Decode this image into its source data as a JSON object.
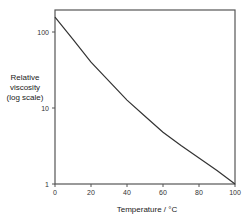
{
  "chart_data": {
    "type": "line",
    "title": "",
    "xlabel": "Temperature / °C",
    "ylabel": "Relative viscosity (log scale)",
    "ylabel_lines": [
      "Relative",
      "viscosity",
      "(log scale)"
    ],
    "yscale": "log",
    "xlim": [
      0,
      100
    ],
    "ylim": [
      1,
      195
    ],
    "x_ticks": [
      "0",
      "20",
      "40",
      "60",
      "80",
      "100"
    ],
    "y_ticks": [
      "1",
      "10",
      "100"
    ],
    "grid": false,
    "legend": null,
    "series": [
      {
        "name": "Relative viscosity",
        "x": [
          0,
          10,
          20,
          30,
          40,
          50,
          60,
          70,
          80,
          90,
          100
        ],
        "values": [
          157,
          80,
          40,
          22.5,
          12.7,
          7.8,
          4.8,
          3.2,
          2.2,
          1.5,
          1.0
        ]
      }
    ]
  }
}
